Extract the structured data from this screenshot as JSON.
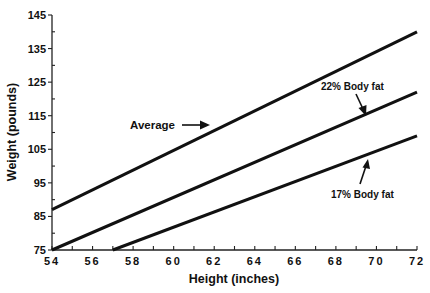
{
  "chart_data": {
    "type": "line",
    "title": "",
    "xlabel": "Height (inches)",
    "ylabel": "Weight (pounds)",
    "xlim": [
      54,
      72
    ],
    "ylim": [
      75,
      145
    ],
    "x_ticks": [
      54,
      56,
      58,
      60,
      62,
      64,
      66,
      68,
      70,
      72
    ],
    "y_ticks": [
      75,
      85,
      95,
      105,
      115,
      125,
      135,
      145
    ],
    "grid": false,
    "legend": "none (inline annotations with arrows)",
    "series": [
      {
        "name": "Average",
        "x": [
          54,
          72
        ],
        "y": [
          87,
          140
        ]
      },
      {
        "name": "22% Body fat",
        "x": [
          54,
          72
        ],
        "y": [
          75,
          122
        ]
      },
      {
        "name": "17% Body fat",
        "x": [
          57,
          72
        ],
        "y": [
          75,
          109
        ]
      }
    ],
    "annotations": [
      {
        "text": "Average",
        "points_to_series": "Average"
      },
      {
        "text": "22% Body fat",
        "points_to_series": "22% Body fat"
      },
      {
        "text": "17% Body fat",
        "points_to_series": "17% Body fat"
      }
    ]
  },
  "labels": {
    "xlabel": "Height  (inches)",
    "ylabel": "Weight  (pounds)",
    "annot_average": "Average",
    "annot_22": "22%  Body  fat",
    "annot_17": "17%  Body  fat"
  },
  "colors": {
    "line": "#111111",
    "axis": "#222222",
    "background": "#ffffff"
  }
}
